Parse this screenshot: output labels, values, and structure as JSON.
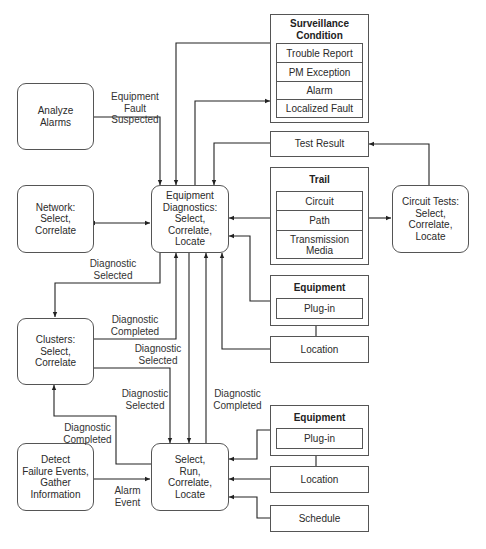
{
  "diagram": {
    "processes": {
      "analyze_alarms": "Analyze\nAlarms",
      "network": "Network:\nSelect,\nCorrelate",
      "equipment_diagnostics": "Equipment\nDiagnostics:\nSelect,\nCorrelate,\nLocate",
      "clusters": "Clusters:\nSelect,\nCorrelate",
      "detect_failure": "Detect\nFailure Events,\nGather\nInformation",
      "select_run": "Select,\nRun,\nCorrelate,\nLocate",
      "circuit_tests": "Circuit Tests:\nSelect,\nCorrelate,\nLocate"
    },
    "surveillance": {
      "title": "Surveillance\nCondition",
      "items": [
        "Trouble Report",
        "PM Exception",
        "Alarm",
        "Localized Fault"
      ]
    },
    "test_result": "Test Result",
    "trail": {
      "title": "Trail",
      "items": [
        "Circuit",
        "Path",
        "Transmission\nMedia"
      ]
    },
    "equipment_upper": {
      "title": "Equipment",
      "item": "Plug-in"
    },
    "location_upper": "Location",
    "equipment_lower": {
      "title": "Equipment",
      "item": "Plug-in"
    },
    "location_lower": "Location",
    "schedule": "Schedule",
    "edge_labels": {
      "equipment_fault_suspected": "Equipment Fault\nSuspected",
      "diag_selected_1": "Diagnostic\nSelected",
      "diag_completed_1": "Diagnostic\nCompleted",
      "diag_selected_2": "Diagnostic\nSelected",
      "diag_selected_3": "Diagnostic\nSelected",
      "diag_completed_2": "Diagnostic\nCompleted",
      "diag_completed_3": "Diagnostic\nCompleted",
      "alarm_event": "Alarm\nEvent"
    },
    "colors": {
      "line": "#222222",
      "border": "#555555",
      "background": "#ffffff"
    }
  }
}
